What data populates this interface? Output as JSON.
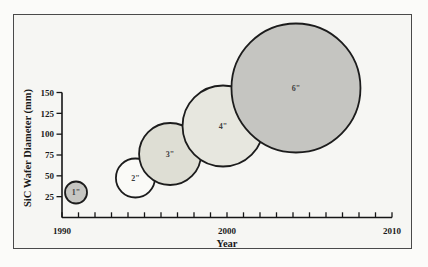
{
  "figure": {
    "kind": "scanned-book-figure",
    "page_background": "#fbfbf9",
    "frame_border_color": "#4a4a4a",
    "frame_fill": "#f6f6f3",
    "axis_color": "#161616",
    "bubble_stroke": "#1c1c1c"
  },
  "chart_data": {
    "type": "scatter",
    "subtype": "bubble",
    "title": "",
    "xlabel": "Year",
    "ylabel": "SiC Wafer Diameter (mm)",
    "xlim": [
      1990,
      2010
    ],
    "ylim": [
      0,
      157
    ],
    "x_major_ticks": [
      1990,
      2000,
      2010
    ],
    "x_minor_tick_step_years": 1,
    "y_ticks": [
      25,
      50,
      75,
      100,
      125,
      150
    ],
    "grid": false,
    "legend": "none",
    "points": [
      {
        "label": "1\"",
        "wafer_inches": 1,
        "wafer_diameter_mm": 25,
        "year": 1990.85,
        "plot_mm": 30.0,
        "bubble_radius_px": 11,
        "fill": "#c6c6c2"
      },
      {
        "label": "2\"",
        "wafer_inches": 2,
        "wafer_diameter_mm": 50,
        "year": 1994.45,
        "plot_mm": 47.4,
        "bubble_radius_px": 19.5,
        "fill": "#fafaf7"
      },
      {
        "label": "3\"",
        "wafer_inches": 3,
        "wafer_diameter_mm": 75,
        "year": 1996.55,
        "plot_mm": 76.2,
        "bubble_radius_px": 31,
        "fill": "#deded4"
      },
      {
        "label": "4\"",
        "wafer_inches": 4,
        "wafer_diameter_mm": 100,
        "year": 1999.76,
        "plot_mm": 109.8,
        "bubble_radius_px": 40.5,
        "fill": "#e7e7df"
      },
      {
        "label": "6\"",
        "wafer_inches": 6,
        "wafer_diameter_mm": 150,
        "year": 2004.18,
        "plot_mm": 155.4,
        "bubble_radius_px": 64.5,
        "fill": "#c5c5c1"
      }
    ]
  }
}
